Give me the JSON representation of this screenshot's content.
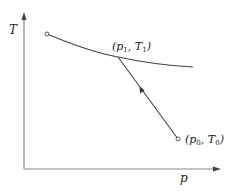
{
  "diagram": {
    "type": "thermodynamic p-T process diagram",
    "axes": {
      "x_label": "p",
      "y_label": "T",
      "color": "#888888"
    },
    "curve_color": "#444444",
    "points": {
      "start_curve": {
        "label": ""
      },
      "state1": {
        "label_open": "(p",
        "sub1": "1",
        "sep": ", T",
        "sub2": "1",
        "label_close": ")"
      },
      "state0": {
        "label_open": "(p",
        "sub1": "0",
        "sep": ", T",
        "sub2": "0",
        "label_close": ")"
      }
    },
    "arrow_direction": "from (p0, T0) toward (p1, T1)"
  }
}
